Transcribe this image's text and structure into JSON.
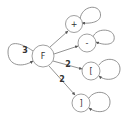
{
  "diagram": {
    "type": "state-graph",
    "nodes": [
      {
        "id": "F",
        "label": "F"
      },
      {
        "id": "plus",
        "label": "+"
      },
      {
        "id": "minus",
        "label": "-"
      },
      {
        "id": "lbracket",
        "label": "["
      },
      {
        "id": "rbracket",
        "label": "]"
      }
    ],
    "edges": [
      {
        "from": "F",
        "to": "F",
        "label": "3"
      },
      {
        "from": "F",
        "to": "plus",
        "label": ""
      },
      {
        "from": "F",
        "to": "minus",
        "label": ""
      },
      {
        "from": "F",
        "to": "lbracket",
        "label": "2"
      },
      {
        "from": "F",
        "to": "rbracket",
        "label": "2"
      },
      {
        "from": "plus",
        "to": "plus",
        "label": ""
      },
      {
        "from": "minus",
        "to": "minus",
        "label": ""
      },
      {
        "from": "lbracket",
        "to": "lbracket",
        "label": ""
      },
      {
        "from": "rbracket",
        "to": "rbracket",
        "label": ""
      }
    ],
    "colors": {
      "stroke": "#888888",
      "text": "#333333",
      "background": "#ffffff"
    }
  }
}
